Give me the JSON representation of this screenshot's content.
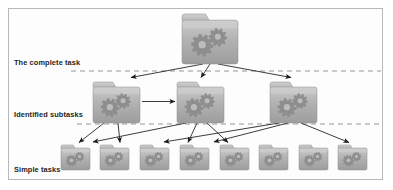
{
  "diagram": {
    "background_color": "#fdfdfd",
    "border_color": "#b8b8b8",
    "divider_color": "#8a8a8a",
    "arrow_color": "#1a1a1a",
    "folder_body_color": "#a9a9a9",
    "folder_light_color": "#c6c6c6",
    "folder_gear_color": "#8d8d8d"
  },
  "tiers": [
    {
      "id": "tier-complete-task",
      "label": "The complete task",
      "label_x": 14,
      "label_y": 62,
      "divider_y": 71,
      "divider_start_x": 71
    },
    {
      "id": "tier-identified-subtasks",
      "label": "Identified subtasks",
      "label_x": 14,
      "label_y": 114,
      "divider_y": 124,
      "divider_start_x": 77
    },
    {
      "id": "tier-simple-tasks",
      "label": "Simple tasks",
      "label_x": 14,
      "label_y": 170,
      "divider_y": null,
      "divider_start_x": null
    }
  ],
  "nodes": {
    "root": [
      {
        "id": "task-root",
        "name": "complete-task-folder",
        "x": 182,
        "y": 14,
        "w": 56,
        "h": 50,
        "gears": 2
      }
    ],
    "subtasks": [
      {
        "id": "subtask-1",
        "name": "subtask-folder-1",
        "x": 93,
        "y": 82,
        "w": 47,
        "h": 41,
        "gears": 2
      },
      {
        "id": "subtask-2",
        "name": "subtask-folder-2",
        "x": 177,
        "y": 82,
        "w": 47,
        "h": 41,
        "gears": 2
      },
      {
        "id": "subtask-3",
        "name": "subtask-folder-3",
        "x": 270,
        "y": 82,
        "w": 47,
        "h": 41,
        "gears": 2
      }
    ],
    "simple": [
      {
        "id": "simple-1",
        "name": "simple-task-folder-1",
        "x": 61,
        "y": 145,
        "w": 29,
        "h": 25,
        "gears": 2
      },
      {
        "id": "simple-2",
        "name": "simple-task-folder-2",
        "x": 100,
        "y": 145,
        "w": 29,
        "h": 25,
        "gears": 2
      },
      {
        "id": "simple-3",
        "name": "simple-task-folder-3",
        "x": 140,
        "y": 145,
        "w": 29,
        "h": 25,
        "gears": 2
      },
      {
        "id": "simple-4",
        "name": "simple-task-folder-4",
        "x": 180,
        "y": 145,
        "w": 29,
        "h": 25,
        "gears": 2
      },
      {
        "id": "simple-5",
        "name": "simple-task-folder-5",
        "x": 220,
        "y": 145,
        "w": 29,
        "h": 25,
        "gears": 2
      },
      {
        "id": "simple-6",
        "name": "simple-task-folder-6",
        "x": 259,
        "y": 145,
        "w": 29,
        "h": 25,
        "gears": 2
      },
      {
        "id": "simple-7",
        "name": "simple-task-folder-7",
        "x": 299,
        "y": 145,
        "w": 29,
        "h": 25,
        "gears": 2
      },
      {
        "id": "simple-8",
        "name": "simple-task-folder-8",
        "x": 338,
        "y": 145,
        "w": 29,
        "h": 25,
        "gears": 2
      }
    ]
  },
  "edges": [
    {
      "id": "edge-root-sub1",
      "from": "task-root",
      "to": "subtask-1",
      "x1": 203,
      "y1": 64,
      "x2": 130,
      "y2": 78
    },
    {
      "id": "edge-root-sub2",
      "from": "task-root",
      "to": "subtask-2",
      "x1": 210,
      "y1": 64,
      "x2": 201,
      "y2": 78
    },
    {
      "id": "edge-root-sub3",
      "from": "task-root",
      "to": "subtask-3",
      "x1": 218,
      "y1": 64,
      "x2": 292,
      "y2": 78
    },
    {
      "id": "edge-sub1-sub2",
      "from": "subtask-1",
      "to": "subtask-2",
      "x1": 143,
      "y1": 102,
      "x2": 174,
      "y2": 102
    },
    {
      "id": "edge-sub1-simple1",
      "from": "subtask-1",
      "to": "simple-1",
      "x1": 104,
      "y1": 124,
      "x2": 79,
      "y2": 143
    },
    {
      "id": "edge-sub1-simple3",
      "from": "subtask-1",
      "to": "simple-3",
      "x1": 118,
      "y1": 124,
      "x2": 119,
      "y2": 143
    },
    {
      "id": "edge-sub2-simple2",
      "from": "subtask-2",
      "to": "simple-2",
      "x1": 186,
      "y1": 124,
      "x2": 94,
      "y2": 143
    },
    {
      "id": "edge-sub2-simple4",
      "from": "subtask-2",
      "to": "simple-4",
      "x1": 196,
      "y1": 124,
      "x2": 187,
      "y2": 143
    },
    {
      "id": "edge-sub2-simple5",
      "from": "subtask-2",
      "to": "simple-5",
      "x1": 206,
      "y1": 124,
      "x2": 226,
      "y2": 143
    },
    {
      "id": "edge-sub3-simple4b",
      "from": "subtask-3",
      "to": "simple-4",
      "x1": 280,
      "y1": 124,
      "x2": 165,
      "y2": 143
    },
    {
      "id": "edge-sub3-simple5b",
      "from": "subtask-3",
      "to": "simple-5",
      "x1": 288,
      "y1": 124,
      "x2": 215,
      "y2": 143
    },
    {
      "id": "edge-sub3-simple8",
      "from": "subtask-3",
      "to": "simple-8",
      "x1": 300,
      "y1": 124,
      "x2": 348,
      "y2": 143
    }
  ]
}
